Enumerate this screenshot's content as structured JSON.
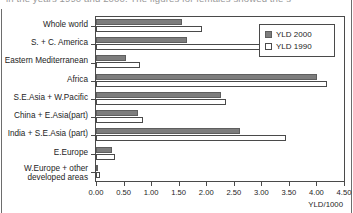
{
  "caption": "in the years 1990 and 2000. The figures for females showed the s",
  "chart_data": {
    "type": "bar",
    "orientation": "horizontal",
    "title": "",
    "xlabel": "YLD/1000",
    "ylabel": "",
    "xlim": [
      0.0,
      4.5
    ],
    "xticks": [
      "0.00",
      "0.50",
      "1.00",
      "1.50",
      "2.00",
      "2.50",
      "3.00",
      "3.50",
      "4.00",
      "4.50"
    ],
    "xtick_values": [
      0.0,
      0.5,
      1.0,
      1.5,
      2.0,
      2.5,
      3.0,
      3.5,
      4.0,
      4.5
    ],
    "grid": false,
    "legend_position": "top-right",
    "categories": [
      "Whole world",
      "S. + C. America",
      "Eastern Mediterranean",
      "Africa",
      "S.E.Asia + W.Pacific",
      "China + E.Asia(part)",
      "India + S.E.Asia (part)",
      "E.Europe",
      "W.Europe + other developed areas"
    ],
    "series": [
      {
        "name": "YLD 2000",
        "color": "#7d7d7d",
        "values": [
          1.56,
          1.65,
          0.55,
          4.01,
          2.26,
          0.77,
          2.61,
          0.29,
          0.04
        ]
      },
      {
        "name": "YLD 1990",
        "color": "#ffffff",
        "values": [
          1.93,
          3.03,
          0.79,
          4.19,
          2.35,
          0.86,
          3.45,
          0.35,
          0.07
        ]
      }
    ]
  }
}
